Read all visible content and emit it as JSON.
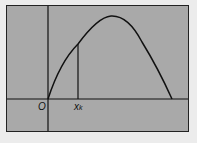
{
  "diagram": {
    "origin_label": "O",
    "xk_label": "x",
    "xk_subscript": "k",
    "colors": {
      "background": "#ececec",
      "panel": "#a9a9a9",
      "line": "#111111"
    }
  }
}
